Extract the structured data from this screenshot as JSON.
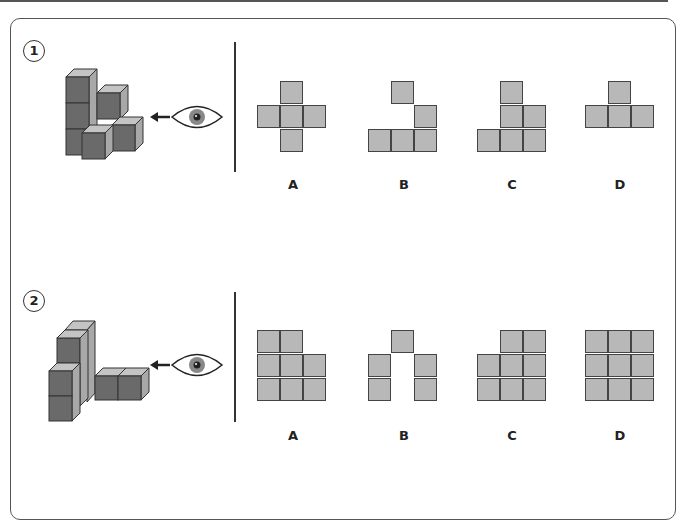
{
  "problems": [
    {
      "number": "1",
      "view_direction": "from right (eye looking left)",
      "options": [
        {
          "label": "A",
          "cells": [
            [
              0,
              1
            ],
            [
              1,
              0
            ],
            [
              1,
              1
            ],
            [
              1,
              2
            ],
            [
              2,
              1
            ]
          ]
        },
        {
          "label": "B",
          "cells": [
            [
              0,
              1
            ],
            [
              1,
              2
            ],
            [
              2,
              0
            ],
            [
              2,
              1
            ],
            [
              2,
              2
            ]
          ]
        },
        {
          "label": "C",
          "cells": [
            [
              0,
              1
            ],
            [
              1,
              1
            ],
            [
              1,
              2
            ],
            [
              2,
              0
            ],
            [
              2,
              1
            ],
            [
              2,
              2
            ]
          ]
        },
        {
          "label": "D",
          "cells": [
            [
              0,
              1
            ],
            [
              1,
              0
            ],
            [
              1,
              1
            ],
            [
              1,
              2
            ]
          ]
        }
      ]
    },
    {
      "number": "2",
      "view_direction": "from right (eye looking left)",
      "options": [
        {
          "label": "A",
          "cells": [
            [
              0,
              0
            ],
            [
              0,
              1
            ],
            [
              1,
              0
            ],
            [
              1,
              1
            ],
            [
              1,
              2
            ],
            [
              2,
              0
            ],
            [
              2,
              1
            ],
            [
              2,
              2
            ]
          ]
        },
        {
          "label": "B",
          "cells": [
            [
              0,
              1
            ],
            [
              1,
              0
            ],
            [
              1,
              2
            ],
            [
              2,
              0
            ],
            [
              2,
              2
            ]
          ]
        },
        {
          "label": "C",
          "cells": [
            [
              0,
              1
            ],
            [
              0,
              2
            ],
            [
              1,
              0
            ],
            [
              1,
              1
            ],
            [
              1,
              2
            ],
            [
              2,
              0
            ],
            [
              2,
              1
            ],
            [
              2,
              2
            ]
          ]
        },
        {
          "label": "D",
          "cells": [
            [
              0,
              0
            ],
            [
              0,
              1
            ],
            [
              0,
              2
            ],
            [
              1,
              0
            ],
            [
              1,
              1
            ],
            [
              1,
              2
            ],
            [
              2,
              0
            ],
            [
              2,
              1
            ],
            [
              2,
              2
            ]
          ]
        }
      ]
    }
  ],
  "icons": {
    "eye": "eye-icon",
    "arrow": "arrow-left-icon"
  },
  "colors": {
    "cell_fill": "#b8b8b8",
    "cube_front": "#6a6a6a",
    "cube_side": "#a8a8a8",
    "cube_top": "#c4c4c4",
    "stroke": "#444444"
  }
}
